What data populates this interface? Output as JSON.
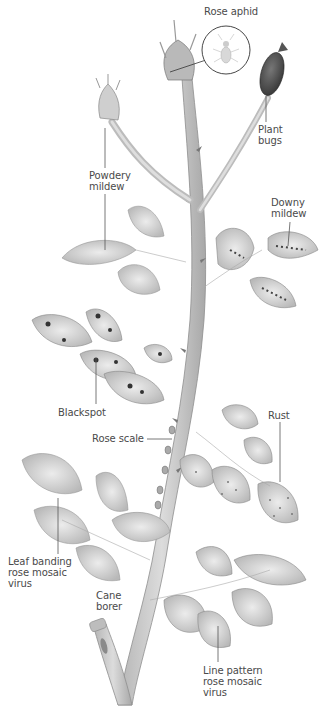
{
  "figure": {
    "colors": {
      "background": "#ffffff",
      "stem": "#c9c9c9",
      "stem_shade": "#9a9a9a",
      "leaf": "#d6d6d6",
      "leaf_dark": "#8a8a8a",
      "spot": "#3a3a3a",
      "label_text": "#4a4a4a",
      "leader_line": "#555555"
    },
    "labels": [
      {
        "id": "rose-aphid",
        "text": "Rose aphid",
        "x": 208,
        "y": 6
      },
      {
        "id": "plant-bugs",
        "text": "Plant\nbugs",
        "x": 258,
        "y": 124
      },
      {
        "id": "powdery-mildew",
        "text": "Powdery\nmildew",
        "x": 89,
        "y": 170
      },
      {
        "id": "downy-mildew",
        "text": "Downy\nmildew",
        "x": 271,
        "y": 197
      },
      {
        "id": "blackspot",
        "text": "Blackspot",
        "x": 58,
        "y": 407
      },
      {
        "id": "rose-scale",
        "text": "Rose scale",
        "x": 92,
        "y": 433
      },
      {
        "id": "rust",
        "text": "Rust",
        "x": 268,
        "y": 410
      },
      {
        "id": "leaf-banding-rose-mosaic-virus",
        "text": "Leaf banding\nrose mosaic\nvirus",
        "x": 8,
        "y": 556
      },
      {
        "id": "cane-borer",
        "text": "Cane\nborer",
        "x": 96,
        "y": 590
      },
      {
        "id": "line-pattern-rose-mosaic-virus",
        "text": "Line pattern\nrose mosaic\nvirus",
        "x": 203,
        "y": 665
      }
    ]
  }
}
